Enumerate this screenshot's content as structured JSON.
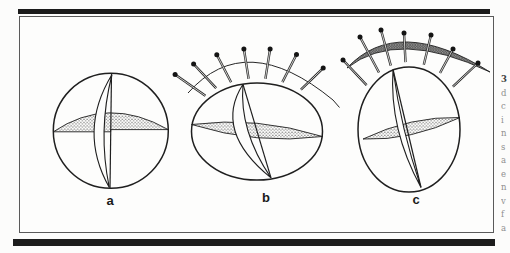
{
  "figure": {
    "panel_labels": [
      "a",
      "b",
      "c"
    ]
  },
  "margin_caption": {
    "lines": [
      "3",
      "d",
      "c",
      "i",
      "n",
      "s",
      "a",
      "e",
      "n",
      "v",
      "f",
      "a"
    ]
  },
  "colors": {
    "ink": "#1f1f1f",
    "rule_black": "#1b1b1b",
    "frame_border": "#5a5a5a",
    "caption_gray": "#8f8f8f",
    "paper": "#fcfcfb"
  }
}
